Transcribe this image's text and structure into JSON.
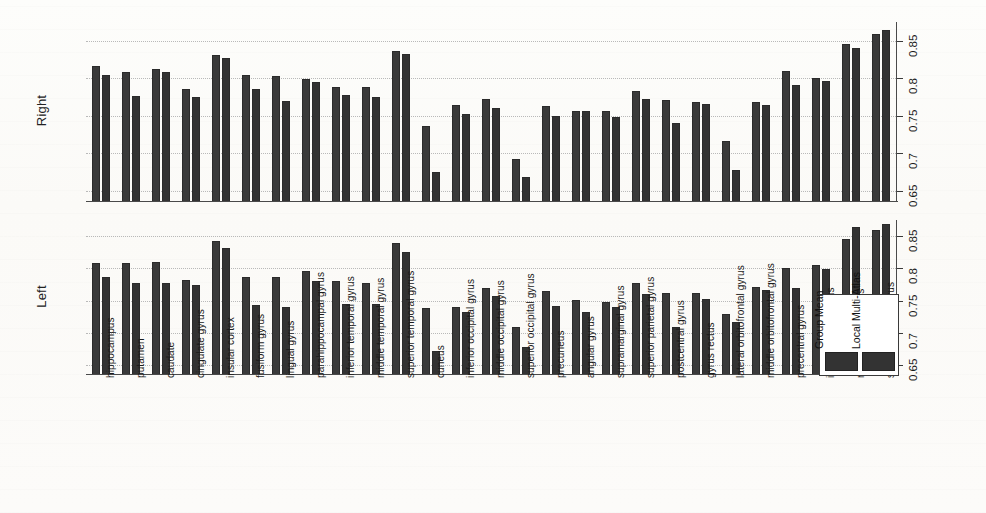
{
  "figure": {
    "panels": [
      {
        "id": "right",
        "label": "Right"
      },
      {
        "id": "left",
        "label": "Left"
      }
    ],
    "legend": {
      "entries": [
        {
          "label": "Group Mean",
          "color": "#333333"
        },
        {
          "label": "Local Multi-Atlas",
          "color": "#333333"
        }
      ]
    },
    "y_tick_labels": [
      "0.65",
      "0.7",
      "0.75",
      "0.8",
      "0.85"
    ]
  },
  "chart_data": {
    "type": "bar",
    "title": "",
    "xlabel": "",
    "ylabel": "",
    "ylim": [
      0.635,
      0.875
    ],
    "yticks": [
      0.65,
      0.7,
      0.75,
      0.8,
      0.85
    ],
    "grid": true,
    "legend_position": "bottom-right",
    "categories": [
      "hippocampus",
      "putamen",
      "caudate",
      "cingulate gyrus",
      "insular cortex",
      "fusiform gyrus",
      "lingual gyrus",
      "parahippocampal gyrus",
      "inferior temporal gyrus",
      "middle temporal gyrus",
      "superior temporal gyrus",
      "cuneus",
      "inferior occipital gyrus",
      "middle occipital gyrus",
      "superior occipital gyrus",
      "precuneus",
      "angular gyrus",
      "supramarginal gyrus",
      "superior parietal gyrus",
      "postcentral gyrus",
      "gyrus rectus",
      "lateral orbitofrontal gyrus",
      "middle orbitofrontal gyrus",
      "precentral gyrus",
      "inferior frontal gyrus",
      "middle frontal gyrus",
      "superior frontal gyrus"
    ],
    "panels": [
      {
        "name": "Right",
        "series": [
          {
            "name": "Group Mean",
            "values": [
              0.817,
              0.809,
              0.812,
              0.786,
              0.831,
              0.804,
              0.803,
              0.799,
              0.788,
              0.789,
              0.837,
              0.737,
              0.764,
              0.772,
              0.692,
              0.763,
              0.757,
              0.757,
              0.783,
              0.771,
              0.768,
              0.716,
              0.768,
              0.81,
              0.801,
              0.846,
              0.859
            ]
          },
          {
            "name": "Local Multi-Atlas",
            "values": [
              0.804,
              0.777,
              0.809,
              0.775,
              0.827,
              0.786,
              0.77,
              0.795,
              0.778,
              0.775,
              0.833,
              0.675,
              0.752,
              0.76,
              0.668,
              0.75,
              0.756,
              0.748,
              0.772,
              0.74,
              0.766,
              0.678,
              0.764,
              0.791,
              0.797,
              0.841,
              0.864
            ]
          }
        ]
      },
      {
        "name": "Left",
        "series": [
          {
            "name": "Group Mean",
            "values": [
              0.808,
              0.809,
              0.81,
              0.782,
              0.843,
              0.786,
              0.786,
              0.796,
              0.78,
              0.777,
              0.84,
              0.738,
              0.741,
              0.769,
              0.709,
              0.765,
              0.751,
              0.748,
              0.777,
              0.762,
              0.762,
              0.729,
              0.772,
              0.801,
              0.805,
              0.845,
              0.859
            ]
          },
          {
            "name": "Local Multi-Atlas",
            "values": [
              0.786,
              0.778,
              0.777,
              0.775,
              0.831,
              0.743,
              0.741,
              0.781,
              0.745,
              0.745,
              0.826,
              0.672,
              0.733,
              0.757,
              0.679,
              0.742,
              0.733,
              0.74,
              0.76,
              0.71,
              0.752,
              0.717,
              0.766,
              0.77,
              0.799,
              0.864,
              0.869
            ]
          }
        ]
      }
    ]
  }
}
